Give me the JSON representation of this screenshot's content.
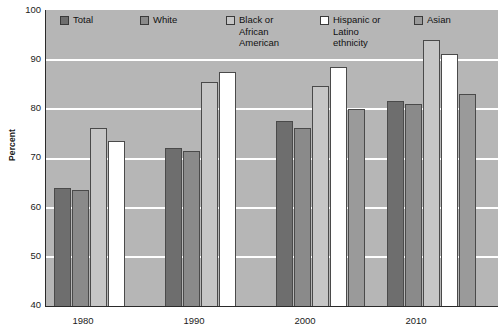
{
  "chart_data": {
    "type": "bar",
    "title": "",
    "xlabel": "",
    "ylabel": "Percent",
    "ylim": [
      40,
      100
    ],
    "ytick_values": [
      100,
      90,
      80,
      70,
      60,
      50,
      40
    ],
    "ytick_labels": [
      "100",
      "90",
      "80",
      "70",
      "60",
      "50",
      "40"
    ],
    "grid": true,
    "gridlines_at": [
      90,
      80,
      70,
      60,
      50
    ],
    "legend_position": "top-inside",
    "categories": [
      "1980",
      "1990",
      "2000",
      "2010"
    ],
    "series": [
      {
        "name": "Total",
        "legend_label": "Total",
        "color": "#6e6e6e",
        "values": [
          64,
          72,
          77.5,
          81.5
        ]
      },
      {
        "name": "White",
        "legend_label": "White",
        "color": "#8a8a8a",
        "values": [
          63.5,
          71.5,
          76,
          81
        ]
      },
      {
        "name": "Black or African American",
        "legend_label": "Black or\nAfrican\nAmerican",
        "color": "#c6c6c6",
        "values": [
          76,
          85.5,
          84.5,
          94
        ]
      },
      {
        "name": "Hispanic or Latino ethnicity",
        "legend_label": "Hispanic or\nLatino\nethnicity",
        "color": "#ffffff",
        "values": [
          73.5,
          87.5,
          88.5,
          91
        ]
      },
      {
        "name": "Asian",
        "legend_label": "Asian",
        "color": "#9a9a9a",
        "values": [
          null,
          null,
          80,
          83
        ]
      }
    ]
  },
  "colors": {
    "plot_background": "#b6b6b6",
    "gridline": "#ffffff",
    "axis": "#2a2a2a",
    "text": "#1b1b1b",
    "page_background": "#ffffff"
  }
}
